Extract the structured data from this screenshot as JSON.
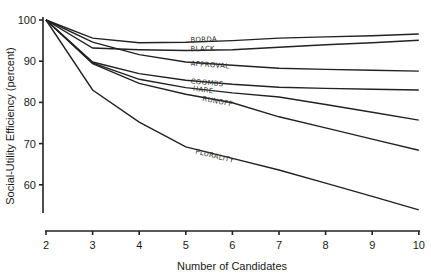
{
  "chart_data": {
    "type": "line",
    "title": "",
    "xlabel": "Number of Candidates",
    "ylabel": "Social-Utility Efficiency (percent)",
    "x": [
      2,
      3,
      4,
      5,
      6,
      7,
      8,
      9,
      10
    ],
    "xlim": [
      2,
      10
    ],
    "ylim": [
      54,
      100
    ],
    "x_ticks": [
      "2",
      "3",
      "4",
      "5",
      "6",
      "7",
      "8",
      "9",
      "10"
    ],
    "y_ticks": [
      "100",
      "90",
      "80",
      "70",
      "60"
    ],
    "grid": false,
    "legend": "inline labels on lines",
    "series": [
      {
        "name": "Borda",
        "values": [
          100,
          95.6,
          94.5,
          94.6,
          95.0,
          95.6,
          95.9,
          96.2,
          96.6
        ],
        "label_at": [
          5.1,
          94.6
        ]
      },
      {
        "name": "Black",
        "values": [
          100,
          93.2,
          92.8,
          92.6,
          92.8,
          93.4,
          94.0,
          94.5,
          95.1
        ],
        "label_at": [
          5.1,
          92.4
        ]
      },
      {
        "name": "Approval",
        "values": [
          100,
          94.6,
          91.6,
          89.8,
          89.0,
          88.3,
          88.0,
          87.8,
          87.6
        ],
        "label_at": [
          5.1,
          88.9
        ]
      },
      {
        "name": "Coombs",
        "values": [
          100,
          89.8,
          87.0,
          85.4,
          84.4,
          83.7,
          83.4,
          83.2,
          83.0
        ],
        "label_at": [
          5.1,
          84.6
        ]
      },
      {
        "name": "Hare",
        "values": [
          100,
          89.6,
          85.6,
          83.6,
          82.3,
          81.3,
          79.5,
          77.6,
          75.7
        ],
        "label_at": [
          5.15,
          82.8
        ]
      },
      {
        "name": "Runoff",
        "values": [
          100,
          89.4,
          84.6,
          82.0,
          79.9,
          76.5,
          73.8,
          71.1,
          68.4
        ],
        "label_at": [
          5.35,
          80.4
        ]
      },
      {
        "name": "Plurality",
        "values": [
          100,
          83.0,
          75.2,
          69.2,
          66.4,
          63.6,
          60.4,
          57.2,
          53.9
        ],
        "label_at": [
          5.2,
          67.6
        ]
      }
    ]
  },
  "labels": {
    "series": [
      "Borda",
      "Black",
      "Approval",
      "Coombs",
      "Hare",
      "Runoff",
      "Plurality"
    ]
  },
  "colors": {
    "line": "#222222",
    "background": "#ffffff"
  }
}
